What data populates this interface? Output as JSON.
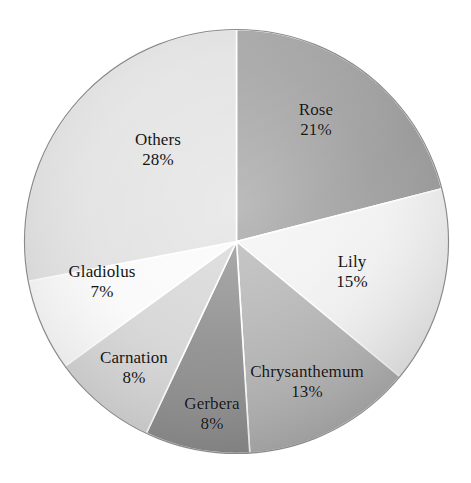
{
  "chart_data": {
    "type": "pie",
    "title": "",
    "subtitle": "",
    "xlabel": "",
    "ylabel": "",
    "legend_position": "none",
    "grid": false,
    "labels_inside_slices": true,
    "units": "percent",
    "total": 100,
    "start_angle_deg": 0,
    "direction": "clockwise",
    "categories": [
      "Rose",
      "Lily",
      "Chrysanthemum",
      "Gerbera",
      "Carnation",
      "Gladiolus",
      "Others"
    ],
    "values": [
      21,
      15,
      13,
      8,
      8,
      7,
      28
    ],
    "slices": [
      {
        "name": "Rose",
        "value": 21,
        "value_text": "21%",
        "color": "#9c9c9c"
      },
      {
        "name": "Lily",
        "value": 15,
        "value_text": "15%",
        "color": "#f2f2f2"
      },
      {
        "name": "Chrysanthemum",
        "value": 13,
        "value_text": "13%",
        "color": "#b4b4b4"
      },
      {
        "name": "Gerbera",
        "value": 8,
        "value_text": "8%",
        "color": "#8e8e8e"
      },
      {
        "name": "Carnation",
        "value": 8,
        "value_text": "8%",
        "color": "#d6d6d6"
      },
      {
        "name": "Gladiolus",
        "value": 7,
        "value_text": "7%",
        "color": "#fafafa"
      },
      {
        "name": "Others",
        "value": 28,
        "value_text": "28%",
        "color": "#e0e0e0"
      }
    ],
    "separator_color": "#ffffff",
    "outline_color": "#8a8a8a",
    "background_color": "#ffffff",
    "label_text_color": "#141414"
  }
}
